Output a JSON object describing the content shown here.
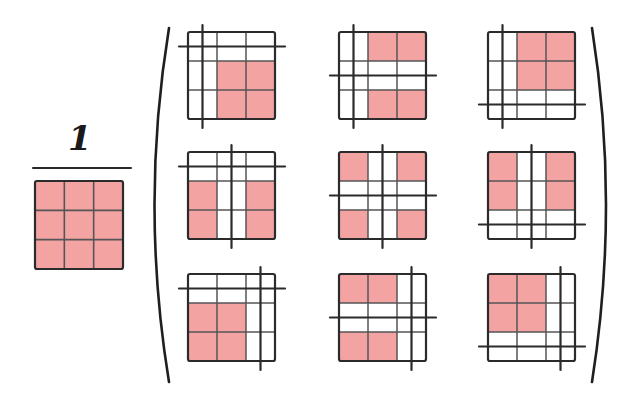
{
  "diagram": {
    "colors": {
      "shade": "#f4a3a3",
      "line": "#2b2b2b",
      "grid_line": "#555555",
      "background": "#ffffff"
    },
    "fraction": {
      "numerator": "1",
      "denominator": {
        "type": "grid",
        "rows": 3,
        "cols": 3,
        "shaded_cells": "all"
      }
    },
    "matrix": {
      "rows": 3,
      "cols": 3,
      "brackets": "parentheses",
      "cells": [
        {
          "row": 0,
          "col": 0,
          "cut_col": 0,
          "cut_row": 0,
          "shaded_cols": [
            1,
            2
          ],
          "shaded_rows": [
            1,
            2
          ]
        },
        {
          "row": 0,
          "col": 1,
          "cut_col": 0,
          "cut_row": 1,
          "shaded_cols": [
            1,
            2
          ],
          "shaded_rows": [
            0,
            2
          ]
        },
        {
          "row": 0,
          "col": 2,
          "cut_col": 0,
          "cut_row": 2,
          "shaded_cols": [
            1,
            2
          ],
          "shaded_rows": [
            0,
            1
          ]
        },
        {
          "row": 1,
          "col": 0,
          "cut_col": 1,
          "cut_row": 0,
          "shaded_cols": [
            0,
            2
          ],
          "shaded_rows": [
            1,
            2
          ]
        },
        {
          "row": 1,
          "col": 1,
          "cut_col": 1,
          "cut_row": 1,
          "shaded_cols": [
            0,
            2
          ],
          "shaded_rows": [
            0,
            2
          ]
        },
        {
          "row": 1,
          "col": 2,
          "cut_col": 1,
          "cut_row": 2,
          "shaded_cols": [
            0,
            2
          ],
          "shaded_rows": [
            0,
            1
          ]
        },
        {
          "row": 2,
          "col": 0,
          "cut_col": 2,
          "cut_row": 0,
          "shaded_cols": [
            0,
            1
          ],
          "shaded_rows": [
            1,
            2
          ]
        },
        {
          "row": 2,
          "col": 1,
          "cut_col": 2,
          "cut_row": 1,
          "shaded_cols": [
            0,
            1
          ],
          "shaded_rows": [
            0,
            2
          ]
        },
        {
          "row": 2,
          "col": 2,
          "cut_col": 2,
          "cut_row": 2,
          "shaded_cols": [
            0,
            1
          ],
          "shaded_rows": [
            0,
            1
          ]
        }
      ]
    }
  }
}
